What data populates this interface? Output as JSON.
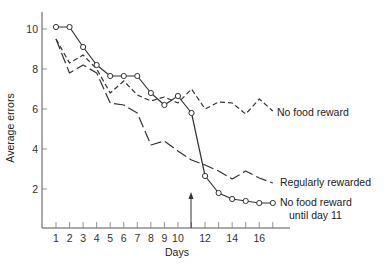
{
  "chart_data": {
    "type": "line",
    "title": "",
    "xlabel": "Days",
    "ylabel": "Average errors",
    "xlim": [
      0,
      18
    ],
    "ylim": [
      0,
      10.8
    ],
    "grid": false,
    "x_ticks": [
      1,
      2,
      3,
      4,
      5,
      6,
      7,
      8,
      9,
      10,
      12,
      14,
      16
    ],
    "x_minor_ticks": [
      11,
      13,
      15,
      17
    ],
    "y_ticks": [
      2,
      4,
      6,
      8,
      10
    ],
    "x": [
      1,
      2,
      3,
      4,
      5,
      6,
      7,
      8,
      9,
      10,
      11,
      12,
      13,
      14,
      15,
      16,
      17
    ],
    "series": [
      {
        "name": "No food reward",
        "style": "short-dash",
        "markers": false,
        "values": [
          9.5,
          8.3,
          8.7,
          8.0,
          6.8,
          7.4,
          6.7,
          6.4,
          6.6,
          6.3,
          7.0,
          6.0,
          6.35,
          6.3,
          5.75,
          6.5,
          5.9
        ]
      },
      {
        "name": "Regularly rewarded",
        "style": "long-dash",
        "markers": false,
        "values": [
          9.5,
          7.8,
          8.2,
          7.8,
          6.3,
          6.2,
          5.8,
          4.2,
          4.4,
          3.9,
          3.45,
          3.2,
          2.9,
          2.5,
          2.9,
          2.55,
          2.3
        ]
      },
      {
        "name": "No food reward until day 11",
        "style": "solid",
        "markers": true,
        "values": [
          10.1,
          10.1,
          9.1,
          8.2,
          7.65,
          7.65,
          7.65,
          6.8,
          6.2,
          6.65,
          5.8,
          2.65,
          1.8,
          1.5,
          1.4,
          1.3,
          1.3
        ]
      }
    ],
    "annotations": [
      {
        "type": "arrow",
        "x": 11,
        "direction": "up",
        "note": "reward introduced at day 11"
      }
    ],
    "legend_position": "inline-right"
  },
  "labels": {
    "xlabel": "Days",
    "ylabel": "Average errors",
    "series_no_food": "No food  reward",
    "series_regular": "Regularly rewarded",
    "series_until_11_line1": "No food  reward",
    "series_until_11_line2": "until day 11"
  }
}
